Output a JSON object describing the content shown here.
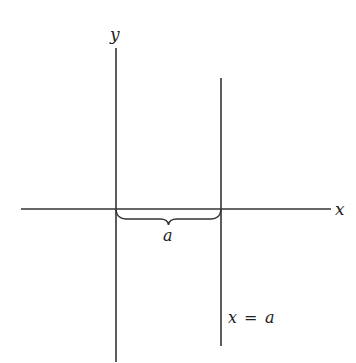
{
  "diagram": {
    "axes": {
      "x_label": "x",
      "y_label": "y"
    },
    "vertical_line": {
      "label_lhs": "x",
      "label_op": "=",
      "label_rhs": "a"
    },
    "brace": {
      "label": "a"
    },
    "colors": {
      "line": "#333333",
      "background": "#ffffff"
    }
  }
}
